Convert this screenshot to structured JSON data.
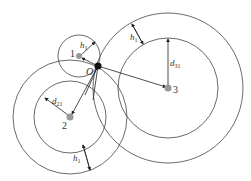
{
  "diagram": {
    "colors": {
      "stroke": "#444444",
      "node": "#999999",
      "center": "#111111"
    },
    "nodes": [
      {
        "id": "1",
        "label": "1"
      },
      {
        "id": "2",
        "label": "2"
      },
      {
        "id": "3",
        "label": "3"
      }
    ],
    "center_label": "O",
    "labels": {
      "h1_top": "h",
      "h1_top_sub": "1",
      "h1_right": "h",
      "h1_right_sub": "1",
      "h1_bottom": "h",
      "h1_bottom_sub": "1",
      "d31": "d",
      "d31_sub": "31",
      "d21": "d",
      "d21_sub": "21"
    }
  }
}
